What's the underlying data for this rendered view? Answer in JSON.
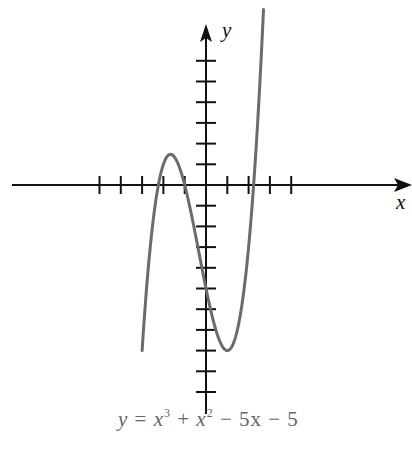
{
  "chart_data": {
    "type": "line",
    "title": "",
    "equation": "y = x^3 + x^2 - 5x - 5",
    "xlabel": "x",
    "ylabel": "y",
    "grid": false,
    "legend": null,
    "xlim": [
      -9.7,
      9.6
    ],
    "ylim": [
      -10.5,
      8.8
    ],
    "x_ticks": [
      -5,
      -4,
      -3,
      -2,
      -1,
      1,
      2,
      3,
      4
    ],
    "y_ticks": [
      -10,
      -9,
      -8,
      -7,
      -6,
      -5,
      -4,
      -3,
      -2,
      -1,
      1,
      2,
      3,
      4,
      5,
      6
    ],
    "series": [
      {
        "name": "y = x^3 + x^2 - 5x - 5",
        "x_range": [
          -3,
          2.7
        ],
        "points": [
          [
            -3,
            -8
          ],
          [
            -2.5,
            -1.875
          ],
          [
            -2.236,
            0
          ],
          [
            -2,
            1
          ],
          [
            -1.67,
            1.48
          ],
          [
            -1.5,
            1.375
          ],
          [
            -1,
            0
          ],
          [
            -0.5,
            -2.375
          ],
          [
            0,
            -5
          ],
          [
            0.5,
            -7.125
          ],
          [
            1,
            -8
          ],
          [
            1.5,
            -6.875
          ],
          [
            2,
            -3
          ],
          [
            2.236,
            0
          ],
          [
            2.5,
            4.375
          ],
          [
            2.7,
            8.12
          ]
        ],
        "color": "#6b6b6b"
      }
    ],
    "roots": [
      -2.236,
      -1,
      2.236
    ],
    "local_max": [
      -1.67,
      1.48
    ],
    "local_min": [
      1,
      -8
    ]
  },
  "labels": {
    "x_axis": "x",
    "y_axis": "y",
    "eq_y": "y",
    "eq_eq": "=",
    "eq_x1": "x",
    "eq_p1": "3",
    "eq_plus": "+",
    "eq_x2": "x",
    "eq_p2": "2",
    "eq_minus1": "−",
    "eq_term": "5x",
    "eq_minus2": "−",
    "eq_const": "5"
  }
}
